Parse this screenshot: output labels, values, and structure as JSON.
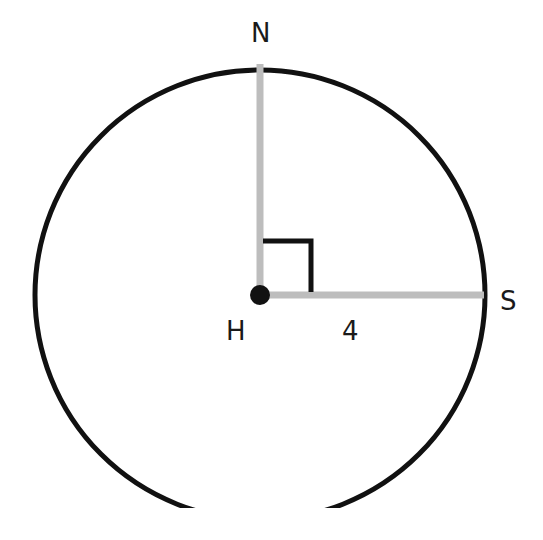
{
  "diagram": {
    "type": "circle-geometry",
    "center": {
      "label": "H"
    },
    "points": [
      {
        "label": "N",
        "position": "top of circle"
      },
      {
        "label": "S",
        "position": "right of circle"
      }
    ],
    "segments": [
      {
        "from": "H",
        "to": "N",
        "length_label": ""
      },
      {
        "from": "H",
        "to": "S",
        "length_label": "4"
      }
    ],
    "right_angle_at": "H",
    "colors": {
      "circle": "#111111",
      "radius": "#bdbdbd",
      "marker": "#111111"
    }
  }
}
